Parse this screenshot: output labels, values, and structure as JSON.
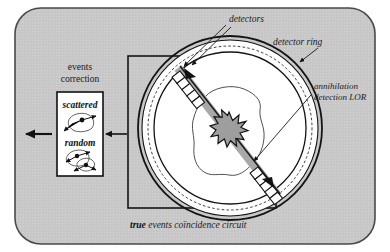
{
  "figure": {
    "type": "pet-scanner-coincidence-detection-diagram",
    "background_color": "#c9c9c9",
    "panel_border_color": "#3a3a3a",
    "ink_color": "#1a1a1a",
    "lor_band_color": "#a8a8a8",
    "burst_color": "#9e9e9e"
  },
  "labels": {
    "detectors": "detectors",
    "detector_ring": "detector ring",
    "annihilation_line1": "annihilation",
    "annihilation_line2": "detection LOR",
    "events_line1": "events",
    "events_line2": "correction",
    "scattered": "scattered",
    "random": "random",
    "caption_bold": "true",
    "caption_rest": " events coïncidence circuit"
  },
  "boxes": {
    "coincidence_circuit": "true events coïncidence circuit",
    "events_correction_panel": "events correction"
  },
  "ring": {
    "detector_block_count": 12,
    "dashed_inner_circle": true,
    "detector_fill": "#ffffff"
  },
  "arrows": {
    "output_arrow": "output-arrow-left",
    "transfer_arrow": "transfer-arrow-left",
    "detector_leaders": 2,
    "lor_leader": 1,
    "ring_leader": 1
  }
}
